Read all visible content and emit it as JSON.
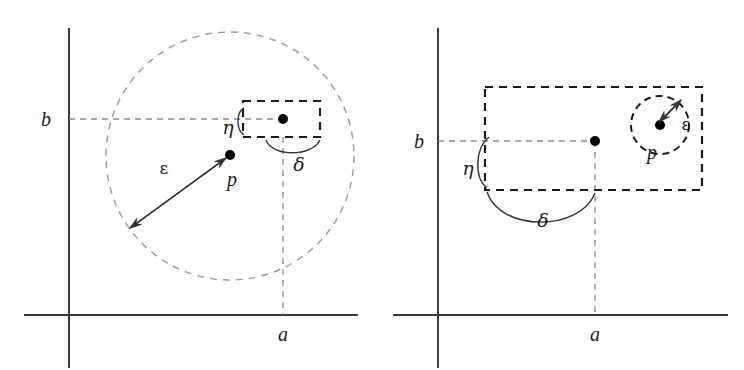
{
  "figure": {
    "type": "math-diagram",
    "background_color": "#ffffff",
    "axis_color": "#3a3a3a",
    "guide_color": "#8a8a8a",
    "rect_color": "#1a1a1a"
  },
  "panels": [
    {
      "id": "left",
      "name": "euclidean-metric-panel",
      "axis_labels": {
        "x": "a",
        "y": "b"
      },
      "point_label": "p",
      "epsilon_label": "ε",
      "eta_label": "η",
      "delta_label": "δ",
      "shapes": {
        "epsilon_ball": "circle",
        "delta_eta_box": "rectangle"
      },
      "geometry": {
        "y_axis_x": 69,
        "x_axis_y": 315,
        "b_line_y": 119,
        "a_line_x": 283,
        "circle_center": [
          230,
          156
        ],
        "circle_radius": 124,
        "point_p": [
          230,
          155
        ],
        "point_ab": [
          283,
          119
        ],
        "rect": [
          243,
          101,
          77,
          36
        ]
      }
    },
    {
      "id": "right",
      "name": "box-metric-panel",
      "axis_labels": {
        "x": "a",
        "y": "b"
      },
      "point_label": "p",
      "epsilon_label": "ε",
      "eta_label": "η",
      "delta_label": "δ",
      "shapes": {
        "epsilon_ball": "circle",
        "delta_eta_box": "rectangle"
      },
      "geometry": {
        "y_axis_x": 438,
        "x_axis_y": 315,
        "b_line_y": 141,
        "a_line_x": 595,
        "circle_center": [
          660,
          125
        ],
        "circle_radius": 29,
        "point_p": [
          660,
          125
        ],
        "point_ab": [
          595,
          141
        ],
        "rect": [
          485,
          87,
          217,
          103
        ]
      }
    }
  ]
}
